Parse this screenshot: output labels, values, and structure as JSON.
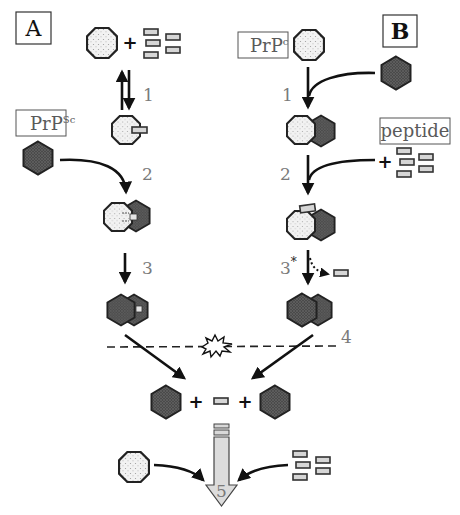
{
  "figure": {
    "panels": {
      "A": {
        "label": "A"
      },
      "B": {
        "label": "B"
      }
    },
    "labels": {
      "prpsc_base": "PrP",
      "prpsc_sup": "Sc",
      "prpc_base": "PrP",
      "prpc_sup": "c",
      "peptide": "peptide"
    },
    "steps": {
      "a1": "1",
      "a2": "2",
      "a3": "3",
      "b1": "1",
      "b2": "2",
      "b3": "3",
      "b3_star": "*",
      "s4": "4",
      "s5": "5"
    },
    "symbols": {
      "plus": "+"
    },
    "legend_shapes": {
      "octagon": "PrPc (dotted octagon)",
      "hexagon": "PrPSc (dark hexagon)",
      "rectangle": "peptide (gray rectangle)"
    },
    "colors": {
      "octagon_fill": "#eeeeee",
      "hexagon_fill": "#5a5a5a",
      "peptide_fill": "#d6d6d6",
      "arrow5_fill": "#dcdcdc",
      "step_text": "#7a7a7a"
    }
  }
}
